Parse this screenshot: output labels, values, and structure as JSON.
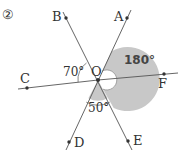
{
  "problem": {
    "number_label": "②"
  },
  "diagram": {
    "center": {
      "label": "O",
      "x": 98,
      "y": 80
    },
    "points": [
      {
        "id": "A",
        "label": "A",
        "x": 127,
        "y": 18,
        "label_x": 114,
        "label_y": 21
      },
      {
        "id": "B",
        "label": "B",
        "x": 66,
        "y": 18,
        "label_x": 52,
        "label_y": 21
      },
      {
        "id": "C",
        "label": "C",
        "x": 27,
        "y": 88,
        "label_x": 20,
        "label_y": 83
      },
      {
        "id": "D",
        "label": "D",
        "x": 69,
        "y": 142,
        "label_x": 74,
        "label_y": 147
      },
      {
        "id": "E",
        "label": "E",
        "x": 128,
        "y": 141,
        "label_x": 133,
        "label_y": 145
      },
      {
        "id": "F",
        "label": "F",
        "x": 164,
        "y": 74,
        "label_x": 158,
        "label_y": 88
      }
    ],
    "angles": [
      {
        "id": "angle-BOC",
        "label": "70°",
        "label_x": 63,
        "label_y": 76,
        "shaded": false
      },
      {
        "id": "angle-AOE-reflex",
        "label": "180°",
        "label_x": 124,
        "label_y": 64,
        "shaded": true
      },
      {
        "id": "angle-DOE",
        "label": "50°",
        "label_x": 88,
        "label_y": 112,
        "shaded": true
      }
    ],
    "shade_color": "#c8c8c8",
    "line_color": "#555555"
  }
}
